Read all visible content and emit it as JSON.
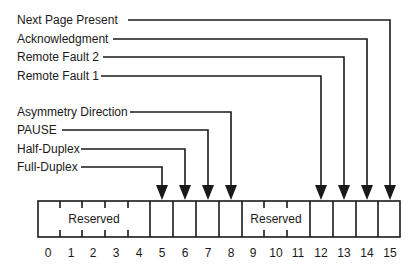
{
  "diagram": {
    "title": "",
    "fields": [
      {
        "label": "Next Page Present",
        "bit": 15
      },
      {
        "label": "Acknowledgment",
        "bit": 14
      },
      {
        "label": "Remote Fault 2",
        "bit": 13
      },
      {
        "label": "Remote Fault 1",
        "bit": 12
      },
      {
        "label": "Asymmetry Direction",
        "bit": 8
      },
      {
        "label": "PAUSE",
        "bit": 7
      },
      {
        "label": "Half-Duplex",
        "bit": 6
      },
      {
        "label": "Full-Duplex",
        "bit": 5
      }
    ],
    "reserved_groups": [
      {
        "label": "Reserved",
        "bits": "0-4"
      },
      {
        "label": "Reserved",
        "bits": "9-11"
      }
    ],
    "bit_numbers": [
      "0",
      "1",
      "2",
      "3",
      "4",
      "5",
      "6",
      "7",
      "8",
      "9",
      "10",
      "11",
      "12",
      "13",
      "14",
      "15"
    ],
    "colors": {
      "line": "#1a1a1a",
      "background": "#ffffff"
    }
  }
}
